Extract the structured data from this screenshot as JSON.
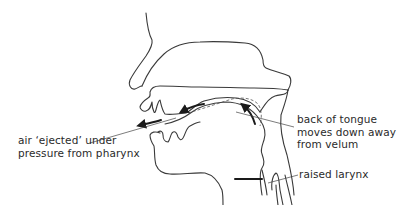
{
  "diagram": {
    "labels": {
      "air_ejected": "air ‘ejected’ under\npressure from pharynx",
      "back_of_tongue": "back of tongue\nmoves down away\nfrom velum",
      "raised_larynx": "raised larynx"
    },
    "colors": {
      "line": "#3a3a3a",
      "arrow": "#1a1a1a",
      "text": "#2a2a2a",
      "background": "#ffffff"
    }
  }
}
